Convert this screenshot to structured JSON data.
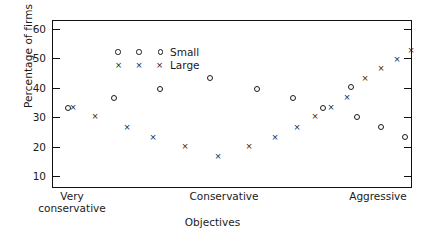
{
  "chart_data": {
    "type": "scatter",
    "title": "",
    "xlabel": "Objectives",
    "ylabel": "Percentage of firms",
    "ylim": [
      6,
      63
    ],
    "yticks": [
      10,
      20,
      30,
      40,
      50,
      60
    ],
    "xlim": [
      0,
      18
    ],
    "xtick_labels": [
      "Very\nconservative",
      "Conservative",
      "Aggressive"
    ],
    "xtick_positions": [
      1,
      8.6,
      16.3
    ],
    "grid": false,
    "legend_position": "top-left",
    "series": [
      {
        "name": "Small",
        "marker": "circle",
        "points": [
          {
            "x": 0.75,
            "y": 33.5
          },
          {
            "x": 3.05,
            "y": 37.0
          },
          {
            "x": 5.35,
            "y": 40.0
          },
          {
            "x": 7.85,
            "y": 43.5
          },
          {
            "x": 10.2,
            "y": 40.0
          },
          {
            "x": 12.0,
            "y": 37.0
          },
          {
            "x": 13.5,
            "y": 33.5
          },
          {
            "x": 14.9,
            "y": 40.5
          },
          {
            "x": 15.2,
            "y": 30.5
          },
          {
            "x": 16.4,
            "y": 27.0
          },
          {
            "x": 17.6,
            "y": 23.5
          }
        ]
      },
      {
        "name": "Large",
        "marker": "x",
        "points": [
          {
            "x": 1.0,
            "y": 33.5
          },
          {
            "x": 2.1,
            "y": 30.5
          },
          {
            "x": 3.7,
            "y": 27.0
          },
          {
            "x": 5.0,
            "y": 23.5
          },
          {
            "x": 6.6,
            "y": 20.5
          },
          {
            "x": 8.25,
            "y": 17.0
          },
          {
            "x": 9.8,
            "y": 20.5
          },
          {
            "x": 11.1,
            "y": 23.5
          },
          {
            "x": 12.2,
            "y": 27.0
          },
          {
            "x": 13.1,
            "y": 30.5
          },
          {
            "x": 13.9,
            "y": 33.5
          },
          {
            "x": 14.7,
            "y": 37.0
          },
          {
            "x": 15.6,
            "y": 43.5
          },
          {
            "x": 16.4,
            "y": 47.0
          },
          {
            "x": 17.2,
            "y": 50.0
          },
          {
            "x": 17.9,
            "y": 53.0
          }
        ]
      }
    ]
  },
  "legend": {
    "entries": [
      {
        "label": "Small",
        "marker": "circle"
      },
      {
        "label": "Large",
        "marker": "x"
      }
    ]
  },
  "colors": {
    "foreground": "#1a1a1a",
    "background": "#ffffff"
  },
  "markers": {
    "x_glyph": "×"
  }
}
